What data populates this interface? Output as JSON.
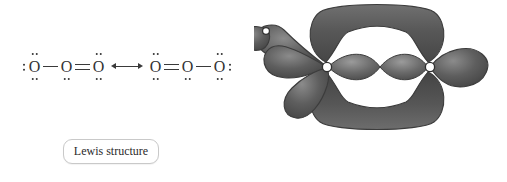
{
  "figure": {
    "background_color": "#ffffff",
    "ink_color": "#333333",
    "orbital_color": "#565656",
    "orbital_highlight_color": "#8d8d8d",
    "orbital_outline_color": "#3c3c3c",
    "atom_circle_fill": "#ffffff"
  },
  "lewis": {
    "caption": "Lewis structure",
    "resonance_arrow_glyph": "↔",
    "structures": [
      {
        "name": "resonance-form-1",
        "atoms": [
          {
            "element": "O",
            "lone_pairs": [
              "left",
              "top",
              "bottom"
            ]
          },
          {
            "element": "O",
            "lone_pairs": [
              "bottom"
            ]
          },
          {
            "element": "O",
            "lone_pairs": [
              "top",
              "bottom"
            ]
          }
        ],
        "bonds": [
          {
            "from": 0,
            "to": 1,
            "order": 1
          },
          {
            "from": 1,
            "to": 2,
            "order": 2
          }
        ]
      },
      {
        "name": "resonance-form-2",
        "atoms": [
          {
            "element": "O",
            "lone_pairs": [
              "top",
              "bottom"
            ]
          },
          {
            "element": "O",
            "lone_pairs": [
              "bottom"
            ]
          },
          {
            "element": "O",
            "lone_pairs": [
              "top",
              "bottom",
              "right"
            ]
          }
        ],
        "bonds": [
          {
            "from": 0,
            "to": 1,
            "order": 2
          },
          {
            "from": 1,
            "to": 2,
            "order": 1
          }
        ]
      }
    ]
  },
  "valence_bond": {
    "caption": "Valence bond model",
    "atom_labels": [
      "O",
      "O"
    ],
    "features": [
      "delocalized-pi-cloud-top",
      "delocalized-pi-cloud-bottom",
      "sigma-bond-lobe-left",
      "sigma-bond-lobe-right",
      "lone-pair-lobe-upper-left",
      "lone-pair-lobe-left",
      "lone-pair-lobe-lower-left",
      "lone-pair-lobe-right"
    ]
  }
}
